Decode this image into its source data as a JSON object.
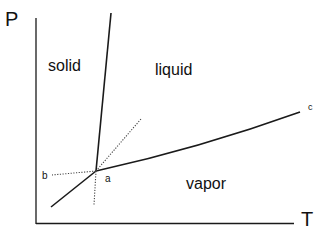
{
  "diagram": {
    "type": "phase-diagram",
    "axes": {
      "y_label": "P",
      "x_label": "T"
    },
    "regions": {
      "solid": "solid",
      "liquid": "liquid",
      "vapor": "vapor"
    },
    "points": {
      "triple_point": "a",
      "metastable_end": "b",
      "critical_point": "c"
    },
    "colors": {
      "line": "#1a1a1a",
      "dotted": "#444444",
      "background": "#ffffff"
    },
    "curves": [
      {
        "name": "melting-curve",
        "style": "solid",
        "from": [
          96,
          171
        ],
        "to": [
          111,
          13
        ]
      },
      {
        "name": "sublimation-curve",
        "style": "solid",
        "from": [
          96,
          171
        ],
        "to": [
          51,
          207
        ]
      },
      {
        "name": "vaporization-curve",
        "style": "solid",
        "from": [
          96,
          171
        ],
        "to": [
          300,
          112
        ]
      },
      {
        "name": "metastable-extension-b",
        "style": "dotted",
        "from": [
          96,
          171
        ],
        "to": [
          52,
          175
        ]
      },
      {
        "name": "metastable-extension-up",
        "style": "dotted",
        "from": [
          96,
          171
        ],
        "to": [
          141,
          119
        ]
      },
      {
        "name": "metastable-extension-down",
        "style": "dotted",
        "from": [
          96,
          171
        ],
        "to": [
          94,
          205
        ]
      }
    ]
  }
}
